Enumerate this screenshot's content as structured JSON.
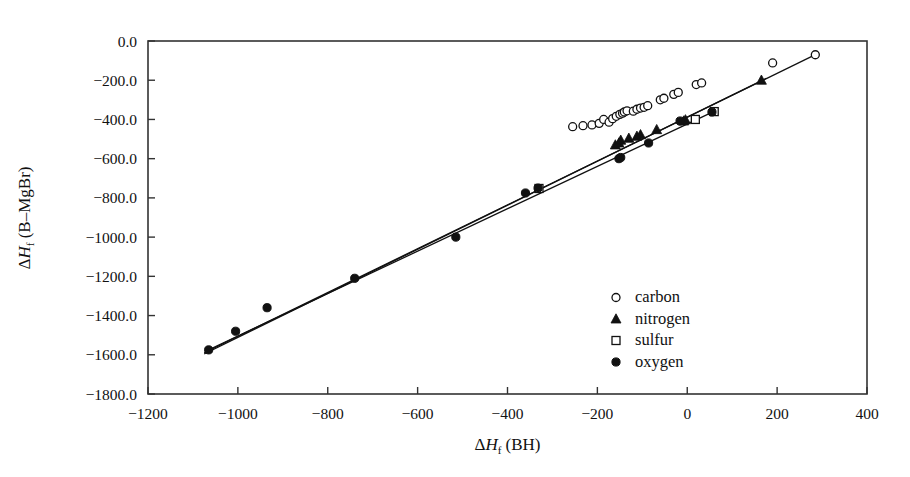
{
  "chart_data": {
    "type": "scatter",
    "title": "",
    "xlabel": "ΔHf (BH)",
    "ylabel": "ΔHf (B–MgBr)",
    "xlim": [
      -1200,
      400
    ],
    "ylim": [
      -1800,
      0
    ],
    "xticks": [
      -1200,
      -1000,
      -800,
      -600,
      -400,
      -200,
      0,
      200,
      400
    ],
    "xticklabels": [
      "-1200",
      "-1000",
      "-800",
      "-600",
      "-400",
      "-200",
      "0",
      "200",
      "400"
    ],
    "yticks": [
      0,
      -200,
      -400,
      -600,
      -800,
      -1000,
      -1200,
      -1400,
      -1600,
      -1800
    ],
    "yticklabels": [
      "0.0",
      "-200.0",
      "-400.0",
      "-600.0",
      "-800.0",
      "-1000.0",
      "-1200.0",
      "-1400.0",
      "-1600.0",
      "-1800.0"
    ],
    "grid": false,
    "legend_position": "center-right",
    "series": [
      {
        "name": "carbon",
        "marker": "open-circle",
        "color": "#111111",
        "points": [
          [
            -255,
            -437
          ],
          [
            -232,
            -432
          ],
          [
            -212,
            -428
          ],
          [
            -196,
            -420
          ],
          [
            -186,
            -400
          ],
          [
            -174,
            -414
          ],
          [
            -166,
            -396
          ],
          [
            -158,
            -384
          ],
          [
            -150,
            -374
          ],
          [
            -144,
            -368
          ],
          [
            -140,
            -362
          ],
          [
            -134,
            -356
          ],
          [
            -120,
            -358
          ],
          [
            -112,
            -348
          ],
          [
            -104,
            -342
          ],
          [
            -96,
            -338
          ],
          [
            -88,
            -330
          ],
          [
            -60,
            -300
          ],
          [
            -52,
            -292
          ],
          [
            -30,
            -272
          ],
          [
            -20,
            -262
          ],
          [
            20,
            -222
          ],
          [
            32,
            -214
          ],
          [
            190,
            -112
          ],
          [
            285,
            -70
          ]
        ]
      },
      {
        "name": "nitrogen",
        "marker": "filled-triangle",
        "color": "#111111",
        "points": [
          [
            -160,
            -530
          ],
          [
            -152,
            -520
          ],
          [
            -148,
            -506
          ],
          [
            -130,
            -496
          ],
          [
            -112,
            -486
          ],
          [
            -104,
            -478
          ],
          [
            -68,
            -452
          ],
          [
            -8,
            -408
          ],
          [
            -4,
            -402
          ],
          [
            165,
            -200
          ]
        ]
      },
      {
        "name": "sulfur",
        "marker": "open-square",
        "color": "#111111",
        "points": [
          [
            -330,
            -752
          ],
          [
            18,
            -400
          ],
          [
            60,
            -360
          ]
        ]
      },
      {
        "name": "oxygen",
        "marker": "filled-circle",
        "color": "#111111",
        "points": [
          [
            -1065,
            -1575
          ],
          [
            -1005,
            -1480
          ],
          [
            -935,
            -1360
          ],
          [
            -740,
            -1210
          ],
          [
            -515,
            -1000
          ],
          [
            -360,
            -775
          ],
          [
            -332,
            -750
          ],
          [
            -152,
            -600
          ],
          [
            -148,
            -594
          ],
          [
            -86,
            -520
          ],
          [
            -16,
            -408
          ],
          [
            55,
            -362
          ]
        ]
      }
    ],
    "trend_lines": [
      {
        "name": "carbon-fit",
        "x1": -1075,
        "y1": -1590,
        "x2": 292,
        "y2": -62
      },
      {
        "name": "nitrogen-fit",
        "x1": -1075,
        "y1": -1596,
        "x2": 176,
        "y2": -190
      },
      {
        "name": "oxygen-fit",
        "x1": -1072,
        "y1": -1582,
        "x2": 62,
        "y2": -356
      }
    ],
    "legend": [
      {
        "label": "carbon",
        "marker": "open-circle"
      },
      {
        "label": "nitrogen",
        "marker": "filled-triangle"
      },
      {
        "label": "sulfur",
        "marker": "open-square"
      },
      {
        "label": "oxygen",
        "marker": "filled-circle"
      }
    ]
  },
  "axes": {
    "ylabel_parts": {
      "delta": "Δ",
      "h": "H",
      "sub": "f",
      "rest": "(B–MgBr)"
    },
    "xlabel_parts": {
      "delta": "Δ",
      "h": "H",
      "sub": "f",
      "rest": "(BH)"
    }
  },
  "colors": {
    "ink": "#111111",
    "background": "#ffffff",
    "axis": "#333333"
  }
}
